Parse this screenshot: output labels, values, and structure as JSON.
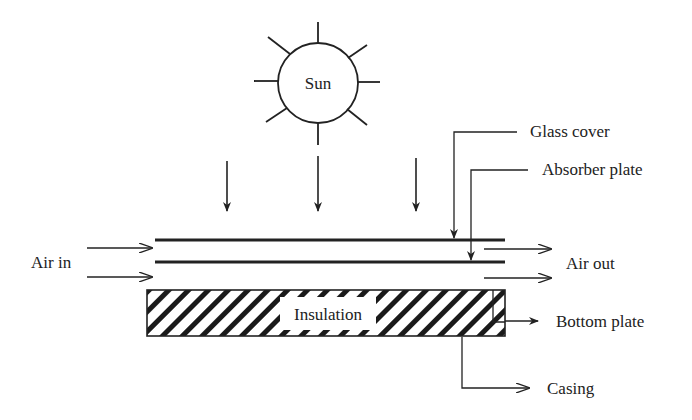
{
  "diagram": {
    "sun_label": "Sun",
    "labels": {
      "glass_cover": "Glass cover",
      "absorber_plate": "Absorber plate",
      "air_in": "Air in",
      "air_out": "Air out",
      "insulation": "Insulation",
      "bottom_plate": "Bottom plate",
      "casing": "Casing"
    },
    "colors": {
      "stroke": "#222222",
      "background": "#ffffff"
    }
  }
}
